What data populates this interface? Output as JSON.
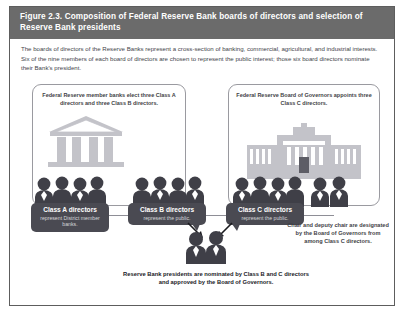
{
  "figure": {
    "title": "Figure 2.3. Composition of Federal Reserve Bank boards of directors and selection of Reserve Bank presidents",
    "intro": "The boards of directors of the Reserve Banks represent a cross-section of banking, commercial, agricultural, and industrial interests. Six of the nine members of each board of directors are chosen to represent the public interest; those six board directors nominate their Bank's president.",
    "header_color": "#6b6b6b",
    "border_color": "#5d5d5d"
  },
  "panels": {
    "left": {
      "caption": "Federal Reserve member banks elect three Class A directors and three Class B directors.",
      "icon": "classical-bank-building-icon"
    },
    "right": {
      "caption": "Federal Reserve Board of Governors appoints three Class C directors.",
      "icon": "eccles-building-icon"
    }
  },
  "bubbles": [
    {
      "title": "Class A directors",
      "subtitle": "represent District member banks.",
      "color": "#4a4a52"
    },
    {
      "title": "Class B directors",
      "subtitle": "represent the public.",
      "color": "#4a4a52"
    },
    {
      "title": "Class C directors",
      "subtitle": "represent the public.",
      "color": "#4a4a52"
    }
  ],
  "notes": {
    "side": "Chair and deputy chair are designated by the Board of Governors from among Class C directors.",
    "bottom": "Reserve Bank presidents are nominated by Class B and C directors and approved by the Board of Governors."
  }
}
